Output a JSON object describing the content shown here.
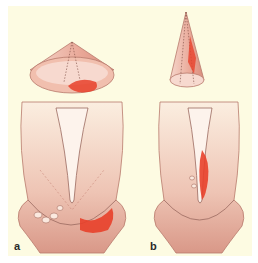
{
  "figure": {
    "panels": [
      {
        "id": "a",
        "label": "a",
        "specimen": "wide-shallow-cone",
        "lesion_location": "ectocervix / transformation zone"
      },
      {
        "id": "b",
        "label": "b",
        "specimen": "narrow-deep-cone",
        "lesion_location": "endocervical canal"
      }
    ],
    "colors": {
      "background": "#fdfbe2",
      "tissue": "#e9b8a8",
      "tissue_dark": "#c98a7a",
      "lesion": "#e8402a",
      "outline": "#9a6a60"
    }
  }
}
